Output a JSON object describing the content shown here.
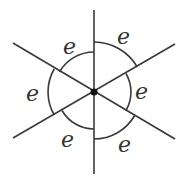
{
  "diagram": {
    "center": {
      "x": 94,
      "y": 92
    },
    "line_color": "#3a3a3a",
    "vertex_color": "#111111",
    "lines": [
      {
        "x1": 94,
        "y1": 10,
        "x2": 94,
        "y2": 174
      },
      {
        "x1": 13,
        "y1": 43,
        "x2": 175,
        "y2": 139
      },
      {
        "x1": 13,
        "y1": 138,
        "x2": 175,
        "y2": 44
      }
    ],
    "arcs": [
      {
        "name": "arc-top-left",
        "d": "M 94 52 A 40 40 0 0 0 59.4 72"
      },
      {
        "name": "arc-top-right",
        "d": "M 94 42 A 50 50 0 0 1 137.3 67"
      },
      {
        "name": "arc-right",
        "d": "M 126 73.5 A 37 37 0 0 1 126 110.5"
      },
      {
        "name": "arc-bottom-right",
        "d": "M 134.7 115.5 A 47 47 0 0 1 94 139"
      },
      {
        "name": "arc-bottom-left",
        "d": "M 94 129 A 37 37 0 0 1 62 110.5"
      },
      {
        "name": "arc-left",
        "d": "M 54.2 115 A 46 46 0 0 1 54.2 69"
      }
    ],
    "labels": [
      {
        "name": "label-top-left",
        "text": "e",
        "x": 63,
        "y": 54
      },
      {
        "name": "label-top-right",
        "text": "e",
        "x": 117,
        "y": 44
      },
      {
        "name": "label-right",
        "text": "e",
        "x": 135,
        "y": 99
      },
      {
        "name": "label-bottom-right",
        "text": "e",
        "x": 118,
        "y": 152
      },
      {
        "name": "label-bottom-left",
        "text": "e",
        "x": 61,
        "y": 147
      },
      {
        "name": "label-left",
        "text": "e",
        "x": 26,
        "y": 101
      }
    ]
  }
}
